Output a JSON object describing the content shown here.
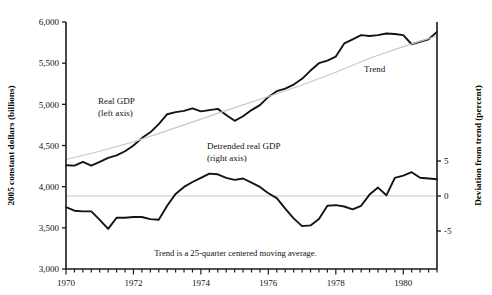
{
  "chart_data": {
    "type": "line",
    "title": "",
    "xlabel": "",
    "ylabel": "2005 constant dollars (billions)",
    "y2label": "Deviation from trend (percent)",
    "grid": false,
    "legend": "annotations",
    "xlim": [
      1970.0,
      1981.0
    ],
    "ylim": [
      3000,
      6000
    ],
    "y2lim": [
      -10.43,
      24.86
    ],
    "x_tick_labels": [
      "1970",
      "1972",
      "1974",
      "1976",
      "1978",
      "1980"
    ],
    "x_tick_values": [
      1970,
      1972,
      1974,
      1976,
      1978,
      1980
    ],
    "x_minor_tick_step": 0.25,
    "y_tick_labels": [
      "3,000",
      "3,500",
      "4,000",
      "4,500",
      "5,000",
      "5,500",
      "6,000"
    ],
    "y_tick_values": [
      3000,
      3500,
      4000,
      4500,
      5000,
      5500,
      6000
    ],
    "y2_tick_labels": [
      "-5",
      "0",
      "5"
    ],
    "y2_tick_values": [
      -5,
      0,
      5
    ],
    "footnote": "Trend is a 25-quarter centered moving average.",
    "annotations": [
      {
        "name": "real-gdp-label",
        "lines": [
          "Real GDP",
          "(left axis)"
        ],
        "x": 98,
        "y": 104
      },
      {
        "name": "trend-label",
        "lines": [
          "Trend"
        ],
        "x": 364,
        "y": 72
      },
      {
        "name": "detrended-label",
        "lines": [
          "Detrended real GDP",
          "(right axis)"
        ],
        "x": 207,
        "y": 149
      }
    ],
    "series": [
      {
        "name": "Real GDP",
        "axis": "left",
        "color": "#131313",
        "x": [
          1970.0,
          1970.25,
          1970.5,
          1970.75,
          1971.0,
          1971.25,
          1971.5,
          1971.75,
          1972.0,
          1972.25,
          1972.5,
          1972.75,
          1973.0,
          1973.25,
          1973.5,
          1973.75,
          1974.0,
          1974.25,
          1974.5,
          1974.75,
          1975.0,
          1975.25,
          1975.5,
          1975.75,
          1976.0,
          1976.25,
          1976.5,
          1976.75,
          1977.0,
          1977.25,
          1977.5,
          1977.75,
          1978.0,
          1978.25,
          1978.5,
          1978.75,
          1979.0,
          1979.25,
          1979.5,
          1979.75,
          1980.0,
          1980.25,
          1980.5,
          1980.75,
          1981.0
        ],
        "y": [
          4260,
          4255,
          4300,
          4255,
          4300,
          4350,
          4380,
          4430,
          4500,
          4590,
          4660,
          4760,
          4880,
          4905,
          4920,
          4950,
          4915,
          4930,
          4945,
          4870,
          4800,
          4855,
          4930,
          4990,
          5090,
          5160,
          5190,
          5240,
          5310,
          5410,
          5500,
          5530,
          5580,
          5740,
          5790,
          5840,
          5830,
          5840,
          5860,
          5855,
          5840,
          5730,
          5760,
          5790,
          5880
        ]
      },
      {
        "name": "Trend",
        "axis": "left",
        "color": "#c9c9c9",
        "x": [
          1970.0,
          1971.0,
          1972.0,
          1973.0,
          1974.0,
          1975.0,
          1976.0,
          1977.0,
          1978.0,
          1979.0,
          1980.0,
          1981.0
        ],
        "y": [
          4330,
          4430,
          4545,
          4680,
          4820,
          4960,
          5095,
          5235,
          5390,
          5560,
          5700,
          5830
        ]
      },
      {
        "name": "Detrended real GDP",
        "axis": "right",
        "color": "#131313",
        "x": [
          1970.0,
          1970.25,
          1970.5,
          1970.75,
          1971.0,
          1971.25,
          1971.5,
          1971.75,
          1972.0,
          1972.25,
          1972.5,
          1972.75,
          1973.0,
          1973.25,
          1973.5,
          1973.75,
          1974.0,
          1974.25,
          1974.5,
          1974.75,
          1975.0,
          1975.25,
          1975.5,
          1975.75,
          1976.0,
          1976.25,
          1976.5,
          1976.75,
          1977.0,
          1977.25,
          1977.5,
          1977.75,
          1978.0,
          1978.25,
          1978.5,
          1978.75,
          1979.0,
          1979.25,
          1979.5,
          1979.75,
          1980.0,
          1980.25,
          1980.5,
          1980.75,
          1981.0
        ],
        "y": [
          -1.6,
          -2.1,
          -2.2,
          -2.2,
          -3.4,
          -4.7,
          -3.1,
          -3.1,
          -3.0,
          -3.0,
          -3.3,
          -3.4,
          -1.4,
          0.3,
          1.3,
          2.0,
          2.6,
          3.2,
          3.1,
          2.6,
          2.3,
          2.5,
          1.9,
          1.3,
          0.4,
          -0.3,
          -1.8,
          -3.2,
          -4.3,
          -4.2,
          -3.3,
          -1.4,
          -1.3,
          -1.5,
          -1.9,
          -1.4,
          0.2,
          1.2,
          0.1,
          2.6,
          2.9,
          3.4,
          2.6,
          2.5,
          2.4
        ]
      }
    ]
  }
}
